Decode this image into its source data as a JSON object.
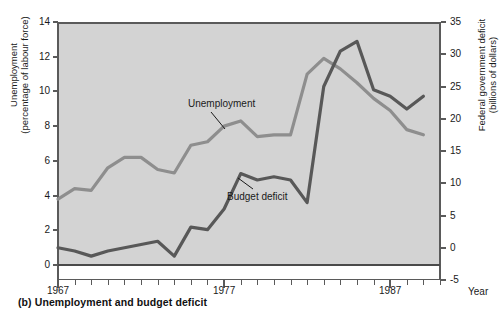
{
  "caption": "(b) Unemployment and budget deficit",
  "axes": {
    "left_title": "Unemployment\n(percentage of labour force)",
    "right_title": "Federal government deficit\n(billions of dollars)",
    "x_title": "Year"
  },
  "colors": {
    "plot_background": "#d3d3d3",
    "unemployment_line": "#8e8e8e",
    "deficit_line": "#585858",
    "axis": "#5a5a5a",
    "text": "#1a1a1a"
  },
  "chart_data": {
    "type": "line",
    "title": "(b) Unemployment and budget deficit",
    "xlabel": "Year",
    "ylabel": "Unemployment (percentage of labour force)",
    "y2label": "Federal government deficit (billions of dollars)",
    "xlim": [
      1967,
      1990
    ],
    "ylim": [
      0,
      14
    ],
    "y2lim": [
      -5,
      35
    ],
    "grid": false,
    "legend": "inline-annotations",
    "x_ticks_major": [
      1967,
      1977,
      1987
    ],
    "x_tick_labels": [
      "1967",
      "1977",
      "1987"
    ],
    "y_ticks_left": [
      0,
      2,
      4,
      6,
      8,
      10,
      12,
      14
    ],
    "y_tick_labels_left": [
      "0",
      "2",
      "4",
      "6",
      "8",
      "10",
      "12",
      "14"
    ],
    "y_ticks_right": [
      -5,
      0,
      5,
      10,
      15,
      20,
      25,
      30,
      35
    ],
    "y_tick_labels_right": [
      "-5",
      "0",
      "5",
      "10",
      "15",
      "20",
      "25",
      "30",
      "35"
    ],
    "x": [
      1967,
      1968,
      1969,
      1970,
      1971,
      1972,
      1973,
      1974,
      1975,
      1976,
      1977,
      1978,
      1979,
      1980,
      1981,
      1982,
      1983,
      1984,
      1985,
      1986,
      1987,
      1988,
      1989
    ],
    "series": [
      {
        "name": "Unemployment",
        "axis": "left",
        "units": "percentage of labour force",
        "color": "#8e8e8e",
        "values": [
          3.8,
          4.4,
          4.3,
          5.6,
          6.2,
          6.2,
          5.5,
          5.3,
          6.9,
          7.1,
          8.0,
          8.3,
          7.4,
          7.5,
          7.5,
          11.0,
          11.9,
          11.3,
          10.5,
          9.6,
          8.9,
          7.8,
          7.5
        ]
      },
      {
        "name": "Budget deficit",
        "axis": "right",
        "units": "billions of dollars",
        "color": "#585858",
        "values": [
          0.0,
          -0.5,
          -1.3,
          -0.5,
          0.0,
          0.5,
          1.0,
          -1.3,
          3.2,
          2.8,
          6.0,
          11.5,
          10.5,
          11.0,
          10.5,
          7.0,
          25.0,
          30.5,
          32.0,
          24.5,
          23.5,
          21.5,
          23.5
        ]
      }
    ],
    "annotations": [
      {
        "text": "Unemployment",
        "series": "Unemployment",
        "at_x": 1975
      },
      {
        "text": "Budget deficit",
        "series": "Budget deficit",
        "at_x": 1980
      }
    ]
  }
}
